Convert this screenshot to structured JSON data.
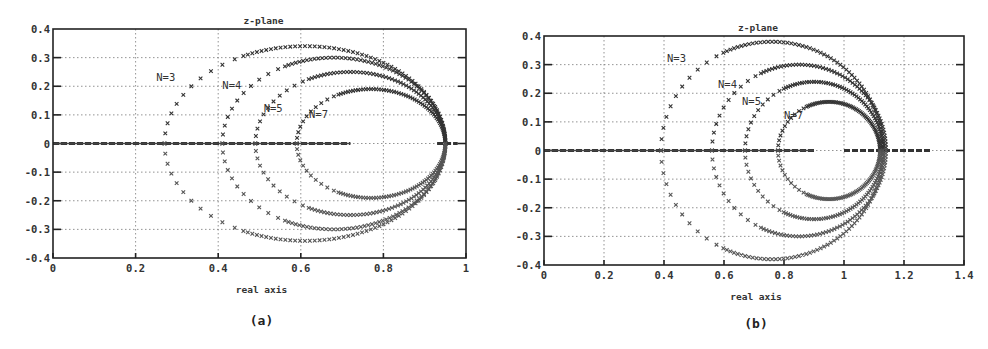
{
  "chart_data": [
    {
      "id": "a",
      "type": "scatter",
      "title": "z-plane",
      "xlabel": "real axis",
      "ylabel": "",
      "caption": "(a)",
      "xlim": [
        0,
        1
      ],
      "ylim": [
        -0.4,
        0.4
      ],
      "xticks": [
        "0",
        "0.2",
        "0.4",
        "0.6",
        "0.8",
        "1"
      ],
      "yticks": [
        "0.4",
        "0.3",
        "0.2",
        "0.1",
        "0",
        "-0.1",
        "-0.2",
        "-0.3",
        "-0.4"
      ],
      "grid": true,
      "marker": "x",
      "annotations": [
        {
          "text": "N=3",
          "x": 0.25,
          "y": 0.22
        },
        {
          "text": "N=4",
          "x": 0.41,
          "y": 0.19
        },
        {
          "text": "N=5",
          "x": 0.51,
          "y": 0.11
        },
        {
          "text": "N=7",
          "x": 0.62,
          "y": 0.09
        }
      ],
      "series": [
        {
          "name": "N=3",
          "center": [
            0.61,
            0.0
          ],
          "rx": 0.34,
          "ry": 0.34,
          "start_x": 0.27,
          "right_x": 0.95
        },
        {
          "name": "N=4",
          "center": [
            0.68,
            0.0
          ],
          "rx": 0.27,
          "ry": 0.3,
          "start_x": 0.41,
          "right_x": 0.95
        },
        {
          "name": "N=5",
          "center": [
            0.72,
            0.0
          ],
          "rx": 0.23,
          "ry": 0.25,
          "start_x": 0.49,
          "right_x": 0.95
        },
        {
          "name": "N=7",
          "center": [
            0.77,
            0.0
          ],
          "rx": 0.18,
          "ry": 0.19,
          "start_x": 0.59,
          "right_x": 0.95
        }
      ],
      "real_axis_points": {
        "dense_ranges": [
          [
            0.0,
            0.72
          ],
          [
            0.93,
            0.98
          ]
        ]
      }
    },
    {
      "id": "b",
      "type": "scatter",
      "title": "z-plane",
      "xlabel": "real axis",
      "ylabel": "",
      "caption": "(b)",
      "xlim": [
        0,
        1.4
      ],
      "ylim": [
        -0.4,
        0.4
      ],
      "xticks": [
        "0",
        "0.2",
        "0.4",
        "0.6",
        "0.8",
        "1",
        "1.2",
        "1.4"
      ],
      "yticks": [
        "0.4",
        "0.3",
        "0.2",
        "0.1",
        "0",
        "-0.1",
        "-0.2",
        "-0.3",
        "-0.4"
      ],
      "grid": true,
      "marker": "x",
      "annotations": [
        {
          "text": "N=3",
          "x": 0.41,
          "y": 0.31
        },
        {
          "text": "N=4",
          "x": 0.58,
          "y": 0.22
        },
        {
          "text": "N=5",
          "x": 0.66,
          "y": 0.16
        },
        {
          "text": "N=7",
          "x": 0.8,
          "y": 0.11
        }
      ],
      "series": [
        {
          "name": "N=3",
          "center": [
            0.76,
            0.0
          ],
          "rx": 0.37,
          "ry": 0.38,
          "start_x": 0.39,
          "right_x": 1.12
        },
        {
          "name": "N=4",
          "center": [
            0.85,
            0.0
          ],
          "rx": 0.29,
          "ry": 0.3,
          "start_x": 0.55,
          "right_x": 1.12
        },
        {
          "name": "N=5",
          "center": [
            0.9,
            0.0
          ],
          "rx": 0.23,
          "ry": 0.24,
          "start_x": 0.66,
          "right_x": 1.12
        },
        {
          "name": "N=7",
          "center": [
            0.95,
            0.0
          ],
          "rx": 0.17,
          "ry": 0.17,
          "start_x": 0.78,
          "right_x": 1.12
        }
      ],
      "real_axis_points": {
        "dense_ranges": [
          [
            0.0,
            0.9
          ],
          [
            1.0,
            1.29
          ]
        ]
      }
    }
  ]
}
